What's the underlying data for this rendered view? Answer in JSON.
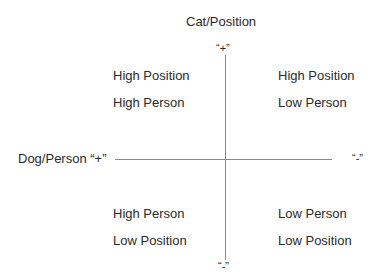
{
  "diagram": {
    "title": "Cat/Position",
    "axes": {
      "vertical": {
        "top_label": "“+”",
        "bottom_label": "“-”"
      },
      "horizontal": {
        "left_label": "Dog/Person “+”",
        "right_label": "“-”"
      }
    },
    "quadrants": {
      "top_left": {
        "line1": "High Position",
        "line2": "High Person"
      },
      "top_right": {
        "line1": "High Position",
        "line2": "Low Person"
      },
      "bottom_left": {
        "line1": "High Person",
        "line2": "Low Position"
      },
      "bottom_right": {
        "line1": "Low Person",
        "line2": "Low Position"
      }
    },
    "colors": {
      "line": "#8a8a8a",
      "text": "#2a2a2a"
    }
  }
}
